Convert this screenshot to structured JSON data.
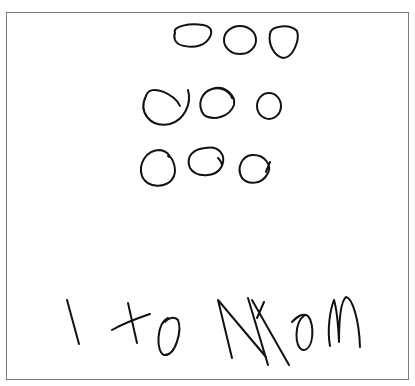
{
  "drawing": {
    "description": "Child's handwritten drawing on paper",
    "circle_rows": [
      {
        "row": 1,
        "count": 3
      },
      {
        "row": 2,
        "count": 3
      },
      {
        "row": 3,
        "count": 3
      }
    ],
    "total_circles": 9,
    "handwritten_text": "1 to Mom",
    "ink_color": "#111111",
    "border_color": "#7a7a7a",
    "background_color": "#ffffff"
  }
}
